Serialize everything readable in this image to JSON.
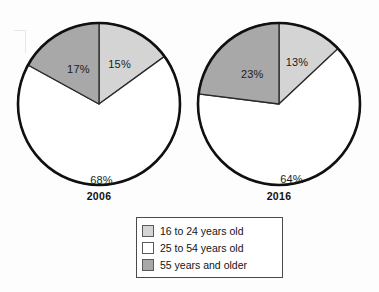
{
  "chart_data": {
    "type": "pie",
    "title": "",
    "legend_position": "bottom-center",
    "categories": [
      "16 to 24 years old",
      "25 to 54 years old",
      "55 years and older"
    ],
    "charts": [
      {
        "label": "2006",
        "values": [
          15,
          68,
          17
        ],
        "data_labels": [
          "15%",
          "68%",
          "17%"
        ]
      },
      {
        "label": "2016",
        "values": [
          13,
          64,
          23
        ],
        "data_labels": [
          "13%",
          "64%",
          "23%"
        ]
      }
    ]
  },
  "legend": {
    "items": [
      {
        "label": "16 to 24 years old",
        "color": "#d4d4d4"
      },
      {
        "label": "25 to 54 years old",
        "color": "#ffffff"
      },
      {
        "label": "55 years and older",
        "color": "#a8a8a8"
      }
    ]
  },
  "colors": {
    "slice_16_24": "#d4d4d4",
    "slice_25_54": "#ffffff",
    "slice_55_plus": "#a8a8a8",
    "outline": "#101010",
    "divider": "#2a2a2a",
    "text": "#141414"
  }
}
